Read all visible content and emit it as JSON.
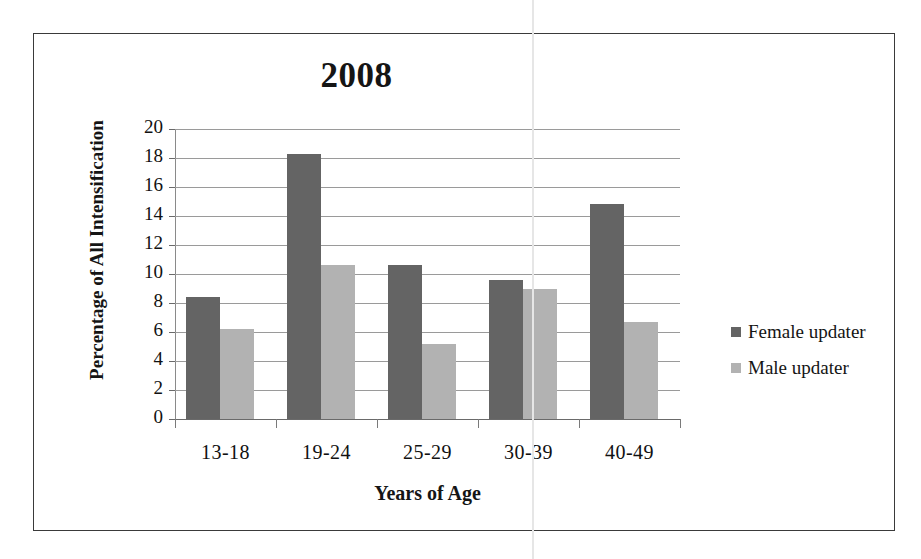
{
  "chart_data": {
    "type": "bar",
    "title": "2008",
    "xlabel": "Years of Age",
    "ylabel": "Percentage of All Intensification",
    "categories": [
      "13-18",
      "19-24",
      "25-29",
      "30-39",
      "40-49"
    ],
    "series": [
      {
        "name": "Female updater",
        "color": "#646464",
        "values": [
          8.4,
          18.3,
          10.6,
          9.6,
          14.8
        ]
      },
      {
        "name": "Male updater",
        "color": "#b2b2b2",
        "values": [
          6.2,
          10.6,
          5.2,
          9.0,
          6.7
        ]
      }
    ],
    "ylim": [
      0,
      20
    ],
    "yticks": [
      20,
      18,
      16,
      14,
      12,
      10,
      8,
      6,
      4,
      2,
      0
    ],
    "grid": true,
    "legend_position": "right"
  },
  "legend": {
    "items": [
      {
        "label": "Female updater"
      },
      {
        "label": "Male updater"
      }
    ]
  }
}
